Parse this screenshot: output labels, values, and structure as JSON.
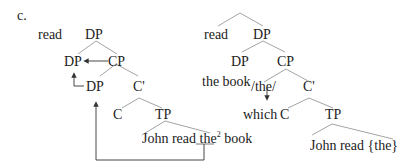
{
  "label": "c.",
  "left_tree": {
    "read": "read",
    "root": "DP",
    "dp_head": "DP",
    "cp": "CP",
    "dp_spec": "DP",
    "cbar": "C'",
    "c": "C",
    "tp": "TP",
    "sentence_pre": "John read ",
    "sentence_the": "the",
    "sentence_sup": "2",
    "sentence_post": " book"
  },
  "right_tree": {
    "read": "read",
    "root": "DP",
    "dp_head": "DP",
    "cp": "CP",
    "the_book": "the book",
    "the_slash": "/the/",
    "cbar": "C'",
    "which": "which",
    "c": "C",
    "tp": "TP",
    "sentence": "John read {the}"
  },
  "colors": {
    "line": "#999999",
    "arrow": "#333333",
    "text": "#222222"
  }
}
